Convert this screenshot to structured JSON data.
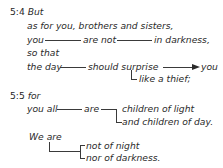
{
  "verse_5_4": {
    "ref": "5:4",
    "line1": "But",
    "line2": "as for you, brothers and sisters,",
    "line3": {
      "subject": "you",
      "verb": "are not",
      "complement": "in darkness,"
    },
    "line4": "so that",
    "line5": {
      "subject": "the day",
      "verb": "should surprise",
      "object": "you"
    },
    "line6": "like a thief;"
  },
  "verse_5_5": {
    "ref": "5:5",
    "line1": "for",
    "line2": {
      "subject": "you all",
      "verb": "are",
      "complement_a": "children of light",
      "complement_b": "and children of day."
    },
    "line3": "We are",
    "line4": {
      "complement_a": "not of night",
      "complement_b": "nor of darkness."
    }
  }
}
